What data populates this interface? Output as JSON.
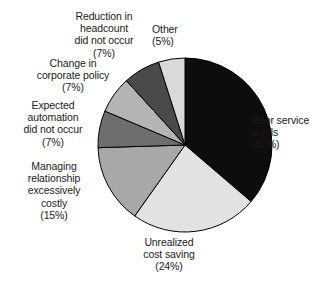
{
  "chart_data": {
    "type": "pie",
    "title": "",
    "subtitle": "",
    "xlabel": "",
    "ylabel": "",
    "legend_position": "none",
    "grid": false,
    "start_angle_deg": 0,
    "direction": "clockwise",
    "categories": [
      "Poor service levels",
      "Unrealized cost saving",
      "Managing relationship excessively costly",
      "Expected automation did not occur",
      "Change in corporate policy",
      "Reduction in headcount did not occur",
      "Other"
    ],
    "values": [
      37,
      24,
      15,
      7,
      7,
      7,
      5
    ],
    "value_unit": "%",
    "slices": [
      {
        "label": "Poor service\nlevels",
        "percent_text": "(37%)",
        "value": 37,
        "color": "#0d0d0d",
        "stroke": "#000000"
      },
      {
        "label": "Unrealized\ncost saving",
        "percent_text": "(24%)",
        "value": 24,
        "color": "#e2e2e2",
        "stroke": "#000000"
      },
      {
        "label": "Managing\nrelationship\nexcessively\ncostly",
        "percent_text": "(15%)",
        "value": 15,
        "color": "#a8a8a8",
        "stroke": "#000000"
      },
      {
        "label": "Expected\nautomation\ndid not occur",
        "percent_text": "(7%)",
        "value": 7,
        "color": "#6e6e6e",
        "stroke": "#000000"
      },
      {
        "label": "Change in\ncorporate policy",
        "percent_text": "(7%)",
        "value": 7,
        "color": "#b4b4b4",
        "stroke": "#000000"
      },
      {
        "label": "Reduction in\nheadcount\ndid not occur",
        "percent_text": "(7%)",
        "value": 7,
        "color": "#4a4a4a",
        "stroke": "#000000"
      },
      {
        "label": "Other",
        "percent_text": "(5%)",
        "value": 5,
        "color": "#d9d9d9",
        "stroke": "#000000"
      }
    ]
  },
  "labels": {
    "poor_service": "Poor service\nlevels\n(37%)",
    "unrealized_cost": "Unrealized\ncost saving\n(24%)",
    "managing_relationship": "Managing\nrelationship\nexcessively\ncostly\n(15%)",
    "expected_automation": "Expected\nautomation\ndid not occur\n(7%)",
    "corporate_policy": "Change in\ncorporate policy\n(7%)",
    "reduction_headcount": "Reduction in\nheadcount\ndid not occur\n(7%)",
    "other": "Other\n(5%)"
  },
  "colors": {
    "background": "#ffffff",
    "text": "#1a1a1a",
    "outline": "#000000"
  }
}
